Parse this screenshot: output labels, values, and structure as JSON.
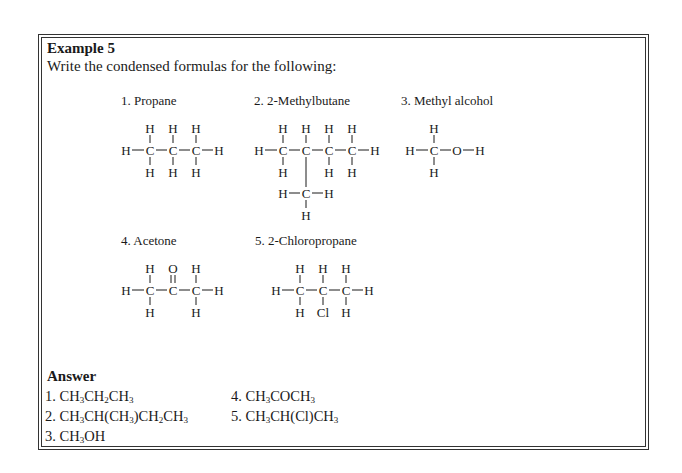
{
  "example": {
    "title": "Example 5",
    "prompt": "Write the condensed formulas for the following:"
  },
  "compounds": [
    {
      "label": "1. Propane"
    },
    {
      "label": "2. 2-Methylbutane"
    },
    {
      "label": "3. Methyl alcohol"
    },
    {
      "label": "4. Acetone"
    },
    {
      "label": "5. 2-Chloropropane"
    }
  ],
  "atoms": {
    "H": "H",
    "C": "C",
    "O": "O",
    "Cl": "Cl"
  },
  "answer": {
    "title": "Answer",
    "items": [
      {
        "num": "1.",
        "formula": "CH3CH2CH3"
      },
      {
        "num": "2.",
        "formula": "CH3CH(CH3)CH2CH3"
      },
      {
        "num": "3.",
        "formula": "CH3OH"
      },
      {
        "num": "4.",
        "formula": "CH3COCH3"
      },
      {
        "num": "5.",
        "formula": "CH3CH(Cl)CH3"
      }
    ]
  }
}
